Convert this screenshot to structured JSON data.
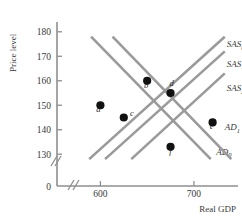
{
  "chart_data": {
    "type": "line",
    "title": "",
    "xlabel": "Real GDP",
    "ylabel": "Price level",
    "xlim": [
      560,
      745
    ],
    "ylim": [
      126,
      184
    ],
    "grid": false,
    "legend_position": "right-inline",
    "axis_breaks": {
      "x": true,
      "y": true
    },
    "origin_label": "0",
    "xticks": [
      600,
      700
    ],
    "xtick_labels": [
      "600",
      "700"
    ],
    "yticks": [
      130,
      140,
      150,
      160,
      170,
      180
    ],
    "ytick_labels": [
      "130",
      "140",
      "150",
      "160",
      "170",
      "180"
    ],
    "series": [
      {
        "name": "SAS0",
        "label": "SAS",
        "sub": "0",
        "kind": "supply",
        "x": [
          588,
          733
        ],
        "y": [
          128,
          178
        ],
        "label_x": 735,
        "label_y": 175
      },
      {
        "name": "SAS1",
        "label": "SAS",
        "sub": "1",
        "kind": "supply",
        "x": [
          605,
          733
        ],
        "y": [
          128,
          172
        ],
        "label_x": 735,
        "label_y": 167
      },
      {
        "name": "SAS2",
        "label": "SAS",
        "sub": "2",
        "kind": "supply",
        "x": [
          633,
          733
        ],
        "y": [
          128,
          163
        ],
        "label_x": 735,
        "label_y": 157
      },
      {
        "name": "AD0",
        "label": "AD",
        "sub": "0",
        "kind": "demand",
        "x": [
          590,
          718
        ],
        "y": [
          178,
          128
        ],
        "label_x": 724,
        "label_y": 131
      },
      {
        "name": "AD1",
        "label": "AD",
        "sub": "1",
        "kind": "demand",
        "x": [
          613,
          740
        ],
        "y": [
          178,
          128
        ],
        "label_x": 733,
        "label_y": 141
      }
    ],
    "points": [
      {
        "label": "a",
        "x": 600,
        "y": 150,
        "label_dx": -2,
        "label_dy": 7
      },
      {
        "label": "b",
        "x": 650,
        "y": 160,
        "label_dx": -1,
        "label_dy": 7
      },
      {
        "label": "c",
        "x": 625,
        "y": 145,
        "label_dx": 8,
        "label_dy": -1
      },
      {
        "label": "d",
        "x": 675,
        "y": 155,
        "label_dx": 1,
        "label_dy": -7
      },
      {
        "label": "e",
        "x": 720,
        "y": 143,
        "label_dx": -1,
        "label_dy": 7
      },
      {
        "label": "f",
        "x": 675,
        "y": 133,
        "label_dx": 0,
        "label_dy": 7
      }
    ],
    "colors": {
      "curve": "#9a9a9a",
      "point": "#111111",
      "axis": "#8f8f8f",
      "text": "#3a3a3a",
      "background": "#ffffff"
    }
  }
}
